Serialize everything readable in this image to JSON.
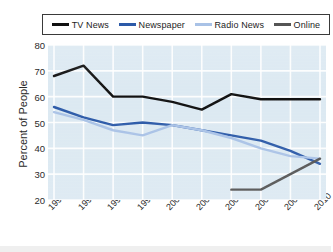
{
  "chart_data": {
    "type": "line",
    "title": "",
    "xlabel": "",
    "ylabel": "Percent of People",
    "categories": [
      "1991",
      "1994",
      "1996",
      "1998",
      "2000",
      "2002",
      "2004",
      "2006",
      "2008",
      "2010"
    ],
    "x": [
      1991,
      1994,
      1996,
      1998,
      2000,
      2002,
      2004,
      2006,
      2008,
      2010
    ],
    "ylim": [
      20,
      80
    ],
    "yticks": [
      20,
      30,
      40,
      50,
      60,
      70,
      80
    ],
    "grid": true,
    "legend_position": "top",
    "series": [
      {
        "name": "TV News",
        "color": "#111111",
        "values": [
          68,
          72,
          60,
          60,
          58,
          55,
          61,
          59,
          59,
          59
        ]
      },
      {
        "name": "Newspaper",
        "color": "#2c5aa8",
        "values": [
          56,
          52,
          49,
          50,
          49,
          47,
          45,
          43,
          39,
          34
        ]
      },
      {
        "name": "Radio News",
        "color": "#a9c2e6",
        "values": [
          54,
          51,
          47,
          45,
          49,
          47,
          44,
          40,
          37,
          36
        ]
      },
      {
        "name": "Online",
        "color": "#555555",
        "values": [
          null,
          null,
          null,
          null,
          null,
          null,
          24,
          24,
          30,
          36
        ]
      }
    ]
  },
  "legend": {
    "items": [
      {
        "label": "TV News",
        "color": "#111111"
      },
      {
        "label": "Newspaper",
        "color": "#2c5aa8"
      },
      {
        "label": "Radio News",
        "color": "#a9c2e6"
      },
      {
        "label": "Online",
        "color": "#555555"
      }
    ]
  },
  "axes": {
    "y_title": "Percent of People",
    "y_ticks": [
      "80",
      "70",
      "60",
      "50",
      "40",
      "30",
      "20"
    ],
    "x_ticks": [
      "1991",
      "1994",
      "1996",
      "1998",
      "2000",
      "2002",
      "2004",
      "2006",
      "2008",
      "2010"
    ]
  },
  "colors": {
    "plot_background": "#dce9f2",
    "gridline": "#ffffff",
    "text": "#2b2b2b"
  }
}
